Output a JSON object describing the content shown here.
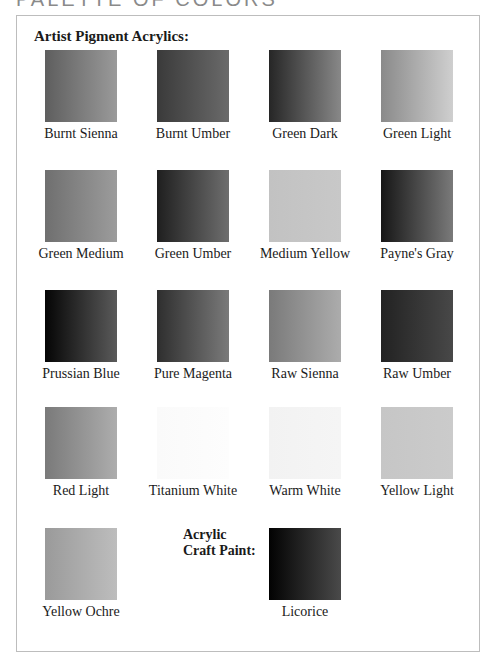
{
  "page": {
    "heading": "PALETTE OF COLORS"
  },
  "sections": {
    "artist_pigment": {
      "title": "Artist Pigment Acrylics:",
      "swatches": [
        {
          "label": "Burnt Sienna",
          "color_from": "#5e5e5e",
          "color_to": "#9a9a9a"
        },
        {
          "label": "Burnt Umber",
          "color_from": "#3a3a3a",
          "color_to": "#6a6a6a"
        },
        {
          "label": "Green Dark",
          "color_from": "#262626",
          "color_to": "#888888"
        },
        {
          "label": "Green Light",
          "color_from": "#8a8a8a",
          "color_to": "#cfcfcf"
        },
        {
          "label": "Green Medium",
          "color_from": "#6f6f6f",
          "color_to": "#9c9c9c"
        },
        {
          "label": "Green Umber",
          "color_from": "#1f1f1f",
          "color_to": "#6e6e6e"
        },
        {
          "label": "Medium Yellow",
          "color_from": "#c2c2c2",
          "color_to": "#c8c8c8"
        },
        {
          "label": "Payne's Gray",
          "color_from": "#161616",
          "color_to": "#7a7a7a"
        },
        {
          "label": "Prussian Blue",
          "color_from": "#050505",
          "color_to": "#5a5a5a"
        },
        {
          "label": "Pure Magenta",
          "color_from": "#2e2e2e",
          "color_to": "#7a7a7a"
        },
        {
          "label": "Raw Sienna",
          "color_from": "#7a7a7a",
          "color_to": "#acacac"
        },
        {
          "label": "Raw Umber",
          "color_from": "#222222",
          "color_to": "#484848"
        },
        {
          "label": "Red Light",
          "color_from": "#7a7a7a",
          "color_to": "#adadad"
        },
        {
          "label": "Titanium White",
          "color_from": "#fafafa",
          "color_to": "#fdfdfd"
        },
        {
          "label": "Warm White",
          "color_from": "#f2f2f2",
          "color_to": "#f5f5f5"
        },
        {
          "label": "Yellow Light",
          "color_from": "#c6c6c6",
          "color_to": "#cbcbcb"
        },
        {
          "label": "Yellow Ochre",
          "color_from": "#9a9a9a",
          "color_to": "#bdbdbd"
        }
      ]
    },
    "craft_paint": {
      "title_line1": "Acrylic",
      "title_line2": "Craft Paint:",
      "swatches": [
        {
          "label": "Licorice",
          "color_from": "#020202",
          "color_to": "#4a4a4a"
        }
      ]
    }
  }
}
